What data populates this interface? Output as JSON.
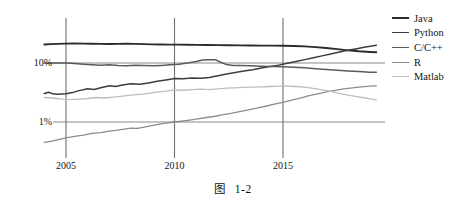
{
  "caption": {
    "prefix": "图",
    "number": "1-2"
  },
  "chart_data": {
    "type": "line",
    "title": "",
    "xlabel": "",
    "ylabel": "",
    "yscale": "log",
    "ylim": [
      0.3,
      30
    ],
    "xlim": [
      2004.0,
      2019.3
    ],
    "grid": true,
    "legend_position": "right",
    "ytick_labels": [
      "10%",
      "1%"
    ],
    "ytick_values": [
      10,
      1
    ],
    "xtick_labels": [
      "2005",
      "2010",
      "2015"
    ],
    "xtick_values": [
      2005,
      2010,
      2015
    ],
    "series": [
      {
        "name": "Java",
        "color": "#2b2b2b",
        "width": 1.9,
        "points": [
          [
            2004.0,
            20.6
          ],
          [
            2004.3,
            20.9
          ],
          [
            2004.6,
            21.1
          ],
          [
            2005.0,
            21.3
          ],
          [
            2005.4,
            21.4
          ],
          [
            2005.8,
            21.3
          ],
          [
            2006.2,
            21.2
          ],
          [
            2006.6,
            21.1
          ],
          [
            2007.0,
            21.0
          ],
          [
            2007.4,
            21.1
          ],
          [
            2007.8,
            21.2
          ],
          [
            2008.2,
            21.1
          ],
          [
            2008.6,
            20.9
          ],
          [
            2009.0,
            20.7
          ],
          [
            2009.4,
            20.6
          ],
          [
            2009.8,
            20.5
          ],
          [
            2010.2,
            20.5
          ],
          [
            2010.6,
            20.4
          ],
          [
            2011.0,
            20.3
          ],
          [
            2011.5,
            20.2
          ],
          [
            2012.0,
            20.1
          ],
          [
            2012.5,
            20.0
          ],
          [
            2013.0,
            19.9
          ],
          [
            2013.5,
            19.8
          ],
          [
            2014.0,
            19.7
          ],
          [
            2014.5,
            19.7
          ],
          [
            2015.0,
            19.6
          ],
          [
            2015.5,
            19.4
          ],
          [
            2016.0,
            19.1
          ],
          [
            2016.5,
            18.6
          ],
          [
            2017.0,
            18.0
          ],
          [
            2017.5,
            17.2
          ],
          [
            2018.0,
            16.4
          ],
          [
            2018.5,
            15.8
          ],
          [
            2019.0,
            15.4
          ],
          [
            2019.3,
            15.2
          ]
        ]
      },
      {
        "name": "Python",
        "color": "#3d3d3d",
        "width": 1.5,
        "points": [
          [
            2004.0,
            3.05
          ],
          [
            2004.2,
            3.2
          ],
          [
            2004.4,
            3.0
          ],
          [
            2004.6,
            2.95
          ],
          [
            2005.0,
            3.0
          ],
          [
            2005.3,
            3.15
          ],
          [
            2005.6,
            3.4
          ],
          [
            2006.0,
            3.65
          ],
          [
            2006.3,
            3.55
          ],
          [
            2006.6,
            3.8
          ],
          [
            2007.0,
            4.1
          ],
          [
            2007.3,
            4.0
          ],
          [
            2007.6,
            4.25
          ],
          [
            2008.0,
            4.45
          ],
          [
            2008.4,
            4.35
          ],
          [
            2008.8,
            4.6
          ],
          [
            2009.2,
            4.9
          ],
          [
            2009.6,
            5.15
          ],
          [
            2010.0,
            5.45
          ],
          [
            2010.4,
            5.4
          ],
          [
            2010.8,
            5.55
          ],
          [
            2011.2,
            5.5
          ],
          [
            2011.6,
            5.7
          ],
          [
            2012.0,
            6.1
          ],
          [
            2012.4,
            6.5
          ],
          [
            2012.8,
            6.9
          ],
          [
            2013.2,
            7.3
          ],
          [
            2013.6,
            7.7
          ],
          [
            2014.0,
            8.2
          ],
          [
            2014.4,
            8.7
          ],
          [
            2014.8,
            9.2
          ],
          [
            2015.2,
            9.9
          ],
          [
            2015.6,
            10.6
          ],
          [
            2016.0,
            11.4
          ],
          [
            2016.4,
            12.3
          ],
          [
            2016.8,
            13.2
          ],
          [
            2017.2,
            14.2
          ],
          [
            2017.6,
            15.3
          ],
          [
            2018.0,
            16.4
          ],
          [
            2018.4,
            17.5
          ],
          [
            2018.8,
            18.6
          ],
          [
            2019.1,
            19.5
          ],
          [
            2019.3,
            20.0
          ]
        ]
      },
      {
        "name": "C/C++",
        "color": "#5a5a5a",
        "width": 1.5,
        "points": [
          [
            2004.0,
            9.95
          ],
          [
            2004.4,
            10.0
          ],
          [
            2005.0,
            10.0
          ],
          [
            2005.4,
            9.8
          ],
          [
            2005.8,
            9.55
          ],
          [
            2006.2,
            9.35
          ],
          [
            2006.6,
            9.2
          ],
          [
            2007.0,
            9.3
          ],
          [
            2007.4,
            9.1
          ],
          [
            2007.8,
            9.0
          ],
          [
            2008.2,
            9.15
          ],
          [
            2008.6,
            9.05
          ],
          [
            2009.0,
            8.95
          ],
          [
            2009.4,
            9.1
          ],
          [
            2009.8,
            9.3
          ],
          [
            2010.2,
            9.55
          ],
          [
            2010.6,
            10.0
          ],
          [
            2011.0,
            10.6
          ],
          [
            2011.3,
            11.2
          ],
          [
            2011.6,
            11.4
          ],
          [
            2011.9,
            11.3
          ],
          [
            2012.1,
            10.4
          ],
          [
            2012.4,
            9.4
          ],
          [
            2012.7,
            9.1
          ],
          [
            2013.0,
            9.05
          ],
          [
            2013.5,
            8.95
          ],
          [
            2014.0,
            8.85
          ],
          [
            2014.5,
            8.75
          ],
          [
            2015.0,
            8.65
          ],
          [
            2015.5,
            8.5
          ],
          [
            2016.0,
            8.3
          ],
          [
            2016.5,
            8.0
          ],
          [
            2017.0,
            7.75
          ],
          [
            2017.5,
            7.55
          ],
          [
            2018.0,
            7.35
          ],
          [
            2018.5,
            7.15
          ],
          [
            2019.0,
            7.0
          ],
          [
            2019.3,
            6.95
          ]
        ]
      },
      {
        "name": "R",
        "color": "#8c8c8c",
        "width": 1.3,
        "points": [
          [
            2004.0,
            0.45
          ],
          [
            2004.3,
            0.47
          ],
          [
            2004.6,
            0.5
          ],
          [
            2005.0,
            0.54
          ],
          [
            2005.4,
            0.57
          ],
          [
            2005.8,
            0.6
          ],
          [
            2006.2,
            0.64
          ],
          [
            2006.6,
            0.66
          ],
          [
            2007.0,
            0.7
          ],
          [
            2007.3,
            0.72
          ],
          [
            2007.6,
            0.75
          ],
          [
            2008.0,
            0.79
          ],
          [
            2008.3,
            0.78
          ],
          [
            2008.6,
            0.82
          ],
          [
            2009.0,
            0.88
          ],
          [
            2009.3,
            0.92
          ],
          [
            2009.6,
            0.96
          ],
          [
            2010.0,
            1.0
          ],
          [
            2010.3,
            1.03
          ],
          [
            2010.6,
            1.07
          ],
          [
            2011.0,
            1.12
          ],
          [
            2011.4,
            1.18
          ],
          [
            2011.8,
            1.24
          ],
          [
            2012.2,
            1.32
          ],
          [
            2012.6,
            1.4
          ],
          [
            2013.0,
            1.5
          ],
          [
            2013.4,
            1.6
          ],
          [
            2013.8,
            1.72
          ],
          [
            2014.2,
            1.85
          ],
          [
            2014.6,
            2.0
          ],
          [
            2015.0,
            2.15
          ],
          [
            2015.4,
            2.35
          ],
          [
            2015.8,
            2.55
          ],
          [
            2016.2,
            2.8
          ],
          [
            2016.6,
            3.0
          ],
          [
            2017.0,
            3.25
          ],
          [
            2017.4,
            3.45
          ],
          [
            2017.8,
            3.65
          ],
          [
            2018.2,
            3.8
          ],
          [
            2018.6,
            3.95
          ],
          [
            2019.0,
            4.05
          ],
          [
            2019.3,
            4.1
          ]
        ]
      },
      {
        "name": "Matlab",
        "color": "#bdbdbd",
        "width": 1.3,
        "points": [
          [
            2004.0,
            2.6
          ],
          [
            2004.4,
            2.55
          ],
          [
            2004.8,
            2.45
          ],
          [
            2005.2,
            2.4
          ],
          [
            2005.6,
            2.45
          ],
          [
            2006.0,
            2.5
          ],
          [
            2006.4,
            2.6
          ],
          [
            2006.8,
            2.55
          ],
          [
            2007.2,
            2.65
          ],
          [
            2007.6,
            2.75
          ],
          [
            2008.0,
            2.85
          ],
          [
            2008.4,
            2.95
          ],
          [
            2008.8,
            3.05
          ],
          [
            2009.2,
            3.2
          ],
          [
            2009.6,
            3.35
          ],
          [
            2010.0,
            3.5
          ],
          [
            2010.4,
            3.45
          ],
          [
            2010.8,
            3.55
          ],
          [
            2011.2,
            3.6
          ],
          [
            2011.6,
            3.55
          ],
          [
            2012.0,
            3.65
          ],
          [
            2012.4,
            3.75
          ],
          [
            2012.8,
            3.8
          ],
          [
            2013.2,
            3.85
          ],
          [
            2013.6,
            3.9
          ],
          [
            2014.0,
            3.95
          ],
          [
            2014.4,
            4.0
          ],
          [
            2014.8,
            4.05
          ],
          [
            2015.2,
            4.05
          ],
          [
            2015.6,
            4.0
          ],
          [
            2016.0,
            3.9
          ],
          [
            2016.4,
            3.7
          ],
          [
            2016.8,
            3.5
          ],
          [
            2017.2,
            3.3
          ],
          [
            2017.6,
            3.05
          ],
          [
            2018.0,
            2.85
          ],
          [
            2018.4,
            2.7
          ],
          [
            2018.8,
            2.55
          ],
          [
            2019.1,
            2.45
          ],
          [
            2019.3,
            2.4
          ]
        ]
      }
    ],
    "legend": [
      {
        "label": "Java",
        "color": "#2b2b2b"
      },
      {
        "label": "Python",
        "color": "#3d3d3d"
      },
      {
        "label": "C/C++",
        "color": "#5a5a5a"
      },
      {
        "label": "R",
        "color": "#8c8c8c"
      },
      {
        "label": "Matlab",
        "color": "#bdbdbd"
      }
    ],
    "axis_colors": {
      "gridline": "#6e6e6e",
      "hgridline": "#8a8a8a",
      "text": "#141414"
    }
  }
}
